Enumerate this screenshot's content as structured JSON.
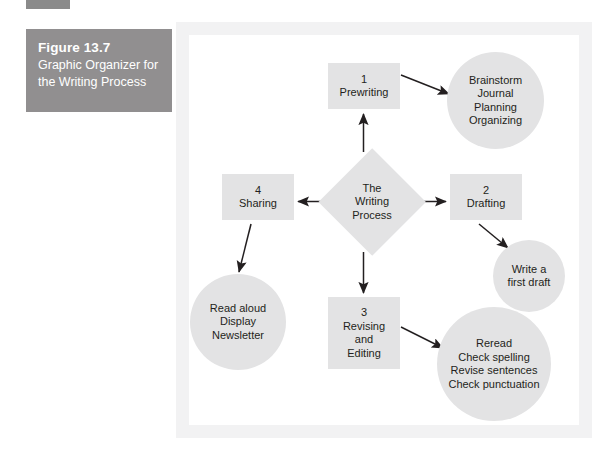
{
  "figure": {
    "caption_title": "Figure 13.7",
    "caption_subtitle": "Graphic Organizer for the Writing Process",
    "caption_bg": "#918f90",
    "panel_bg": "#f2f2f3",
    "node_fill": "#e3e3e4",
    "text_color": "#231f20",
    "connector_color": "#231f20"
  },
  "diagram": {
    "type": "flow-graphic-organizer",
    "center": {
      "shape": "diamond",
      "lines": [
        "The",
        "Writing",
        "Process"
      ]
    },
    "nodes": [
      {
        "id": "prewriting",
        "shape": "rectangle",
        "number": "1",
        "lines": [
          "1",
          "Prewriting"
        ]
      },
      {
        "id": "brainstorm",
        "shape": "circle",
        "lines": [
          "Brainstorm",
          "Journal",
          "Planning",
          "Organizing"
        ]
      },
      {
        "id": "drafting",
        "shape": "rectangle",
        "number": "2",
        "lines": [
          "2",
          "Drafting"
        ]
      },
      {
        "id": "first-draft",
        "shape": "circle",
        "lines": [
          "Write a",
          "first draft"
        ]
      },
      {
        "id": "revising",
        "shape": "rectangle",
        "number": "3",
        "lines": [
          "3",
          "Revising",
          "and",
          "Editing"
        ]
      },
      {
        "id": "checklist",
        "shape": "circle",
        "lines": [
          "Reread",
          "Check spelling",
          "Revise sentences",
          "Check punctuation"
        ]
      },
      {
        "id": "sharing",
        "shape": "rectangle",
        "number": "4",
        "lines": [
          "4",
          "Sharing"
        ]
      },
      {
        "id": "share-ideas",
        "shape": "circle",
        "lines": [
          "Read aloud",
          "Display",
          "Newsletter"
        ]
      }
    ],
    "connectors": [
      {
        "from": "center",
        "to": "prewriting",
        "style": "arrow"
      },
      {
        "from": "prewriting",
        "to": "brainstorm",
        "style": "arrow"
      },
      {
        "from": "center",
        "to": "drafting",
        "style": "arrow"
      },
      {
        "from": "drafting",
        "to": "first-draft",
        "style": "arrow"
      },
      {
        "from": "center",
        "to": "revising",
        "style": "arrow"
      },
      {
        "from": "revising",
        "to": "checklist",
        "style": "arrow"
      },
      {
        "from": "center",
        "to": "sharing",
        "style": "arrow"
      },
      {
        "from": "sharing",
        "to": "share-ideas",
        "style": "arrow"
      }
    ]
  }
}
